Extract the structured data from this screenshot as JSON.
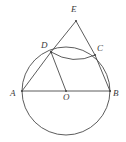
{
  "figure": {
    "kind": "circle-geometry-diagram",
    "width": 126,
    "height": 142,
    "background_color": "#ffffff",
    "stroke_color": "#4a4a4a",
    "label_color": "#3a3a3a",
    "circle": {
      "center_label": "O",
      "center_x": 66,
      "center_y": 91,
      "radius": 44
    },
    "points": {
      "A": {
        "label": "A",
        "x": 22,
        "y": 91,
        "label_x": 10,
        "label_y": 89
      },
      "B": {
        "label": "B",
        "x": 110,
        "y": 91,
        "label_x": 113,
        "label_y": 89
      },
      "C": {
        "label": "C",
        "x": 95,
        "y": 55,
        "label_x": 97,
        "label_y": 44
      },
      "D": {
        "label": "D",
        "x": 51,
        "y": 52,
        "label_x": 41,
        "label_y": 41
      },
      "E": {
        "label": "E",
        "x": 76,
        "y": 21,
        "label_x": 71,
        "label_y": 5
      },
      "O": {
        "label": "O",
        "x": 66,
        "y": 91,
        "label_x": 63,
        "label_y": 93
      }
    },
    "segments": [
      {
        "name": "segment-AB",
        "from": "A",
        "to": "B"
      },
      {
        "name": "segment-AD",
        "from": "A",
        "to": "D"
      },
      {
        "name": "segment-DO",
        "from": "D",
        "to": "O"
      },
      {
        "name": "segment-DE",
        "from": "D",
        "to": "E"
      },
      {
        "name": "segment-EC",
        "from": "E",
        "to": "C"
      },
      {
        "name": "segment-CB",
        "from": "C",
        "to": "B"
      }
    ],
    "arcs": [
      {
        "name": "arc-DC",
        "from": "D",
        "to": "C",
        "bulge": "downward"
      }
    ]
  }
}
